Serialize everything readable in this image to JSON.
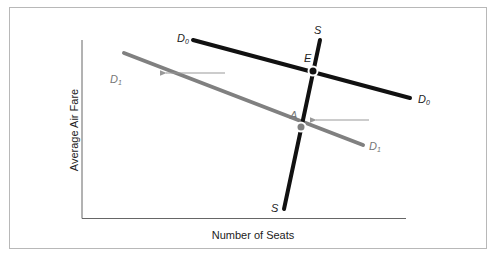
{
  "diagram": {
    "type": "supply-demand shift",
    "axes": {
      "x_label": "Number of Seats",
      "y_label": "Average Air Fare"
    },
    "curves": [
      {
        "id": "D0",
        "label": "D",
        "sub": "0",
        "color": "#111111",
        "from": [
          193,
          40
        ],
        "to": [
          410,
          98
        ]
      },
      {
        "id": "D1",
        "label": "D",
        "sub": "1",
        "color": "#808080",
        "from": [
          124,
          53
        ],
        "to": [
          363,
          145
        ]
      },
      {
        "id": "S",
        "label": "S",
        "sub": "",
        "color": "#111111",
        "from": [
          320,
          40
        ],
        "to": [
          284,
          209
        ]
      }
    ],
    "points": [
      {
        "id": "E",
        "label": "E",
        "color": "#111111",
        "at": [
          313,
          71
        ]
      },
      {
        "id": "A",
        "label": "A",
        "color": "#808080",
        "at": [
          301,
          127
        ]
      }
    ],
    "arrows": [
      {
        "direction": "left",
        "from": [
          225,
          73
        ],
        "to": [
          163,
          73
        ],
        "color": "#999999"
      },
      {
        "direction": "left",
        "from": [
          369,
          120
        ],
        "to": [
          313,
          120
        ],
        "color": "#999999"
      }
    ],
    "labels": {
      "d0_left": {
        "main": "D",
        "sub": "0"
      },
      "d0_right": {
        "main": "D",
        "sub": "0"
      },
      "d1_left": {
        "main": "D",
        "sub": "1"
      },
      "d1_right": {
        "main": "D",
        "sub": "1"
      },
      "s_top": "S",
      "s_bottom": "S",
      "e": "E",
      "a": "A"
    }
  }
}
